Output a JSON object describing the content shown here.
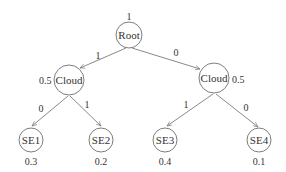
{
  "diagram": {
    "type": "tree",
    "nodes": {
      "root": {
        "label": "Root",
        "value": "1"
      },
      "cloud_left": {
        "label": "Cloud",
        "value": "0.5"
      },
      "cloud_right": {
        "label": "Cloud",
        "value": "0.5"
      },
      "se1": {
        "label": "SE1",
        "value": "0.3"
      },
      "se2": {
        "label": "SE2",
        "value": "0.2"
      },
      "se3": {
        "label": "SE3",
        "value": "0.4"
      },
      "se4": {
        "label": "SE4",
        "value": "0.1"
      }
    },
    "edges": {
      "root_to_cloud_left": {
        "from": "Root",
        "to": "Cloud (left)",
        "label": "1"
      },
      "root_to_cloud_right": {
        "from": "Root",
        "to": "Cloud (right)",
        "label": "0"
      },
      "cloud_left_to_se1": {
        "from": "Cloud (left)",
        "to": "SE1",
        "label": "0"
      },
      "cloud_left_to_se2": {
        "from": "Cloud (left)",
        "to": "SE2",
        "label": "1"
      },
      "cloud_right_to_se3": {
        "from": "Cloud (right)",
        "to": "SE3",
        "label": "1"
      },
      "cloud_right_to_se4": {
        "from": "Cloud (right)",
        "to": "SE4",
        "label": "0"
      }
    }
  }
}
